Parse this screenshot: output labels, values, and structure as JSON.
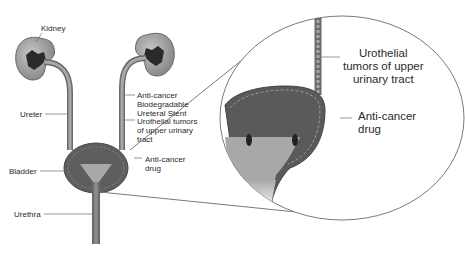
{
  "diagram": {
    "labels": {
      "kidney": "Kidney",
      "ureter": "Ureter",
      "stent": "Anti-cancer\nBiodegradable\nUreteral Stent",
      "tumors_small": "Urothelial tumors\nof upper urinary\ntract",
      "drug_small": "Anti-cancer\ndrug",
      "bladder": "Bladder",
      "urethra": "Urethra",
      "tumors_zoom": "Urothelial\ntumors of upper\nurinary tract",
      "drug_zoom": "Anti-cancer\ndrug"
    },
    "colors": {
      "tissue": "#6e6e6e",
      "tissue_dark": "#4a4a4a",
      "lumen": "#a8a8a8",
      "kidney_inner": "#2a2a2a",
      "outline": "#7a7a7a",
      "text": "#2a2a2a"
    }
  }
}
